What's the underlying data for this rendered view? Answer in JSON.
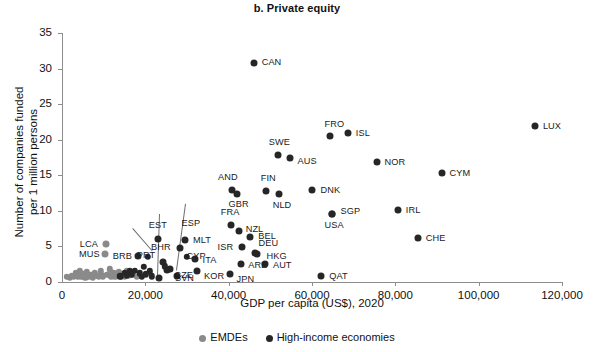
{
  "chart_data": {
    "type": "scatter",
    "title": "b. Private equity",
    "xlabel": "GDP per capita (US$), 2020",
    "ylabel": "Number of companies funded\nper 1 million persons",
    "xlim": [
      0,
      120000
    ],
    "ylim": [
      0,
      35
    ],
    "xticks": [
      0,
      20000,
      40000,
      60000,
      80000,
      100000,
      120000
    ],
    "xtick_labels": [
      "0",
      "20,000",
      "40,000",
      "60,000",
      "80,000",
      "100,000",
      "120,000"
    ],
    "yticks": [
      0,
      5,
      10,
      15,
      20,
      25,
      30,
      35
    ],
    "ytick_labels": [
      "0",
      "5",
      "10",
      "15",
      "20",
      "25",
      "30",
      "35"
    ],
    "grid": false,
    "legend_position": "bottom",
    "series": [
      {
        "name": "EMDEs",
        "color": "#8a8a8a",
        "points": [
          {
            "label": "",
            "x": 1200,
            "y": 0.7
          },
          {
            "label": "",
            "x": 1900,
            "y": 0.6
          },
          {
            "label": "",
            "x": 2400,
            "y": 0.9
          },
          {
            "label": "",
            "x": 2900,
            "y": 0.7
          },
          {
            "label": "",
            "x": 3300,
            "y": 1.3
          },
          {
            "label": "",
            "x": 3800,
            "y": 0.8
          },
          {
            "label": "",
            "x": 4200,
            "y": 1.6
          },
          {
            "label": "",
            "x": 4600,
            "y": 0.7
          },
          {
            "label": "",
            "x": 5100,
            "y": 1.1
          },
          {
            "label": "",
            "x": 5600,
            "y": 0.6
          },
          {
            "label": "",
            "x": 6000,
            "y": 1.4
          },
          {
            "label": "",
            "x": 6500,
            "y": 0.8
          },
          {
            "label": "",
            "x": 7000,
            "y": 1.0
          },
          {
            "label": "",
            "x": 7400,
            "y": 0.6
          },
          {
            "label": "",
            "x": 7900,
            "y": 1.2
          },
          {
            "label": "",
            "x": 8400,
            "y": 0.9
          },
          {
            "label": "",
            "x": 8900,
            "y": 0.7
          },
          {
            "label": "",
            "x": 9300,
            "y": 1.5
          },
          {
            "label": "",
            "x": 9800,
            "y": 0.8
          },
          {
            "label": "MUS",
            "x": 10300,
            "y": 3.9
          },
          {
            "label": "LCA",
            "x": 10500,
            "y": 5.4
          },
          {
            "label": "",
            "x": 10900,
            "y": 1.0
          },
          {
            "label": "",
            "x": 11400,
            "y": 1.8
          },
          {
            "label": "",
            "x": 11800,
            "y": 0.8
          },
          {
            "label": "",
            "x": 12300,
            "y": 1.2
          },
          {
            "label": "",
            "x": 12800,
            "y": 0.7
          },
          {
            "label": "",
            "x": 13200,
            "y": 1.0
          },
          {
            "label": "",
            "x": 13700,
            "y": 1.4
          },
          {
            "label": "",
            "x": 14100,
            "y": 0.8
          },
          {
            "label": "",
            "x": 14600,
            "y": 1.1
          },
          {
            "label": "",
            "x": 15100,
            "y": 0.7
          },
          {
            "label": "",
            "x": 15600,
            "y": 1.6
          },
          {
            "label": "",
            "x": 16100,
            "y": 0.9
          },
          {
            "label": "",
            "x": 17000,
            "y": 1.0
          },
          {
            "label": "",
            "x": 18000,
            "y": 0.7
          }
        ]
      },
      {
        "name": "High-income economies",
        "color": "#262626",
        "points": [
          {
            "label": "",
            "x": 14000,
            "y": 0.8
          },
          {
            "label": "",
            "x": 15000,
            "y": 1.3
          },
          {
            "label": "",
            "x": 15600,
            "y": 0.9
          },
          {
            "label": "",
            "x": 16200,
            "y": 1.5
          },
          {
            "label": "",
            "x": 16800,
            "y": 1.0
          },
          {
            "label": "",
            "x": 17400,
            "y": 1.6
          },
          {
            "label": "BRB",
            "x": 18200,
            "y": 3.6
          },
          {
            "label": "",
            "x": 18600,
            "y": 1.2
          },
          {
            "label": "",
            "x": 19100,
            "y": 0.7
          },
          {
            "label": "",
            "x": 19600,
            "y": 2.1
          },
          {
            "label": "",
            "x": 20100,
            "y": 1.1
          },
          {
            "label": "",
            "x": 20600,
            "y": 3.5
          },
          {
            "label": "",
            "x": 21000,
            "y": 1.5
          },
          {
            "label": "",
            "x": 21500,
            "y": 0.8
          },
          {
            "label": "EST",
            "x": 23000,
            "y": 6.0
          },
          {
            "label": "BHR",
            "x": 23300,
            "y": 0.6
          },
          {
            "label": "PRT",
            "x": 24200,
            "y": 2.8
          },
          {
            "label": "",
            "x": 24600,
            "y": 2.2
          },
          {
            "label": "CZE",
            "x": 25300,
            "y": 1.7
          },
          {
            "label": "SVN",
            "x": 25900,
            "y": 1.8
          },
          {
            "label": "CYP",
            "x": 28200,
            "y": 4.8
          },
          {
            "label": "MLT",
            "x": 29500,
            "y": 5.9
          },
          {
            "label": "",
            "x": 30000,
            "y": 3.5
          },
          {
            "label": "ESP",
            "x": 27500,
            "y": 0.9
          },
          {
            "label": "ITA",
            "x": 31800,
            "y": 3.2
          },
          {
            "label": "KOR",
            "x": 32400,
            "y": 1.6
          },
          {
            "label": "FRA",
            "x": 40500,
            "y": 8.0
          },
          {
            "label": "JPN",
            "x": 40200,
            "y": 1.1
          },
          {
            "label": "AND",
            "x": 40800,
            "y": 13.0
          },
          {
            "label": "GBR",
            "x": 42100,
            "y": 12.3
          },
          {
            "label": "NZL",
            "x": 42400,
            "y": 7.2
          },
          {
            "label": "ISR",
            "x": 43100,
            "y": 4.9
          },
          {
            "label": "ARE",
            "x": 43000,
            "y": 2.5
          },
          {
            "label": "CAN",
            "x": 46000,
            "y": 30.8
          },
          {
            "label": "BEL",
            "x": 45200,
            "y": 6.3
          },
          {
            "label": "DEU",
            "x": 46200,
            "y": 4.1
          },
          {
            "label": "HKG",
            "x": 46700,
            "y": 4.0
          },
          {
            "label": "FIN",
            "x": 48900,
            "y": 12.8
          },
          {
            "label": "AUT",
            "x": 48700,
            "y": 2.5
          },
          {
            "label": "SWE",
            "x": 51800,
            "y": 17.9
          },
          {
            "label": "NLD",
            "x": 52000,
            "y": 12.3
          },
          {
            "label": "AUS",
            "x": 54600,
            "y": 17.5
          },
          {
            "label": "DNK",
            "x": 60100,
            "y": 12.9
          },
          {
            "label": "QAT",
            "x": 62200,
            "y": 0.8
          },
          {
            "label": "FRO",
            "x": 64200,
            "y": 20.5
          },
          {
            "label": "USA",
            "x": 64700,
            "y": 9.5
          },
          {
            "label": "SGP",
            "x": 64900,
            "y": 9.6
          },
          {
            "label": "ISL",
            "x": 68600,
            "y": 20.9
          },
          {
            "label": "NOR",
            "x": 75500,
            "y": 16.9
          },
          {
            "label": "IRL",
            "x": 80600,
            "y": 10.1
          },
          {
            "label": "CHE",
            "x": 85400,
            "y": 6.2
          },
          {
            "label": "CYM",
            "x": 91100,
            "y": 15.3
          },
          {
            "label": "LUX",
            "x": 113500,
            "y": 21.9
          }
        ]
      }
    ],
    "labels_offsets": {
      "LCA": {
        "dx": -26,
        "dy": 1
      },
      "MUS": {
        "dx": -26,
        "dy": 1
      },
      "BRB": {
        "dx": -25,
        "dy": 1
      },
      "SAU": {
        "dx": -42,
        "dy": -18
      },
      "BHR": {
        "dx": -8,
        "dy": -30
      },
      "EST": {
        "dx": -9,
        "dy": -13
      },
      "ESP": {
        "dx": 5,
        "dy": -52
      },
      "PRT": {
        "dx": -26,
        "dy": -6
      },
      "CZE": {
        "dx": 7,
        "dy": 6
      },
      "SVN": {
        "dx": 5,
        "dy": 10
      },
      "CYP": {
        "dx": 7,
        "dy": 9
      },
      "MLT": {
        "dx": 8,
        "dy": 1
      },
      "ITA": {
        "dx": 8,
        "dy": 2
      },
      "KOR": {
        "dx": 7,
        "dy": 6
      },
      "FRA": {
        "dx": -10,
        "dy": -12
      },
      "AND": {
        "dx": -14,
        "dy": -12
      },
      "GBR": {
        "dx": -9,
        "dy": 11
      },
      "NZL": {
        "dx": 7,
        "dy": -1
      },
      "ISR": {
        "dx": -24,
        "dy": 1
      },
      "ARE": {
        "dx": 7,
        "dy": 2
      },
      "JPN": {
        "dx": 7,
        "dy": 6
      },
      "CAN": {
        "dx": 8,
        "dy": 0
      },
      "BEL": {
        "dx": 8,
        "dy": 0
      },
      "DEU": {
        "dx": 4,
        "dy": -9
      },
      "HKG": {
        "dx": 10,
        "dy": 3
      },
      "FIN": {
        "dx": -5,
        "dy": -12
      },
      "AUT": {
        "dx": 8,
        "dy": 2
      },
      "SWE": {
        "dx": -9,
        "dy": -12
      },
      "NLD": {
        "dx": -6,
        "dy": 12
      },
      "AUS": {
        "dx": 8,
        "dy": 4
      },
      "DNK": {
        "dx": 8,
        "dy": 1
      },
      "QAT": {
        "dx": 8,
        "dy": 1
      },
      "FRO": {
        "dx": -5,
        "dy": -11
      },
      "USA": {
        "dx": -7,
        "dy": 12
      },
      "SGP": {
        "dx": 8,
        "dy": -2
      },
      "ISL": {
        "dx": 8,
        "dy": 1
      },
      "NOR": {
        "dx": 8,
        "dy": 1
      },
      "IRL": {
        "dx": 8,
        "dy": 1
      },
      "CHE": {
        "dx": 8,
        "dy": 1
      },
      "CYM": {
        "dx": 8,
        "dy": 1
      },
      "LUX": {
        "dx": 8,
        "dy": 1
      }
    },
    "leaders": [
      {
        "name": "sau-leader",
        "x1": 133,
        "y1": 228,
        "x2": 153,
        "y2": 251
      },
      {
        "name": "bhr-leader",
        "x1": 160,
        "y1": 214,
        "x2": 158,
        "y2": 276
      },
      {
        "name": "esp-leader",
        "x1": 186,
        "y1": 204,
        "x2": 177,
        "y2": 270
      }
    ]
  },
  "legend": {
    "items": [
      {
        "label": "EMDEs",
        "color": "#8a8a8a"
      },
      {
        "label": "High-income economies",
        "color": "#262626"
      }
    ]
  }
}
